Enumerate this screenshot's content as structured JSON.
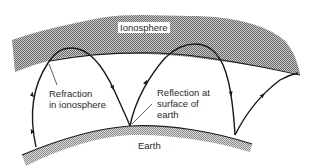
{
  "diagram": {
    "labels": {
      "ionosphere": "Ionosphere",
      "refraction_line1": "Refraction",
      "refraction_line2": "in ionosphere",
      "reflection_line1": "Reflection at",
      "reflection_line2": "surface of",
      "reflection_line3": "earth",
      "earth": "Earth"
    },
    "colors": {
      "ink": "#1a1a1a",
      "hatch_dark": "#6e6e6e",
      "hatch_light": "#c8c8c8",
      "background": "#ffffff"
    }
  }
}
